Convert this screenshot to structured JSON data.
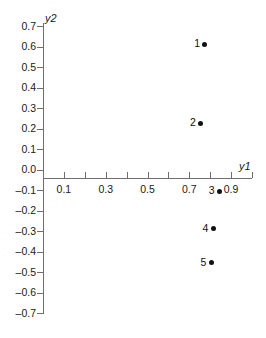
{
  "chart_data": {
    "type": "scatter",
    "title": "",
    "subtitle": "",
    "xlabel": "y1",
    "ylabel": "y2",
    "xlim": [
      0.0,
      1.0
    ],
    "ylim": [
      -0.7,
      0.7
    ],
    "grid": false,
    "legend": null,
    "x_tick_labels": [
      "0.1",
      "0.3",
      "0.5",
      "0.7",
      "0.9"
    ],
    "x_tick_values": [
      0.1,
      0.3,
      0.5,
      0.7,
      0.9
    ],
    "x_minor_tick_values": [
      0.0,
      0.2,
      0.4,
      0.6,
      0.8,
      1.0
    ],
    "y_tick_labels": [
      "0.7",
      "0.6",
      "0.5",
      "0.4",
      "0.3",
      "0.2",
      "0.1",
      "0.0",
      "–0.1",
      "–0.2",
      "–0.3",
      "–0.4",
      "–0.5",
      "–0.6",
      "–0.7"
    ],
    "y_tick_values": [
      0.7,
      0.6,
      0.5,
      0.4,
      0.3,
      0.2,
      0.1,
      0.0,
      -0.1,
      -0.2,
      -0.3,
      -0.4,
      -0.5,
      -0.6,
      -0.7
    ],
    "marker_color": "#111111",
    "axis_color": "#6e6e6e",
    "points": [
      {
        "label": "1",
        "x": 0.775,
        "y": 0.61
      },
      {
        "label": "2",
        "x": 0.755,
        "y": 0.225
      },
      {
        "label": "3",
        "x": 0.845,
        "y": -0.105
      },
      {
        "label": "4",
        "x": 0.815,
        "y": -0.29
      },
      {
        "label": "5",
        "x": 0.805,
        "y": -0.455
      }
    ]
  }
}
